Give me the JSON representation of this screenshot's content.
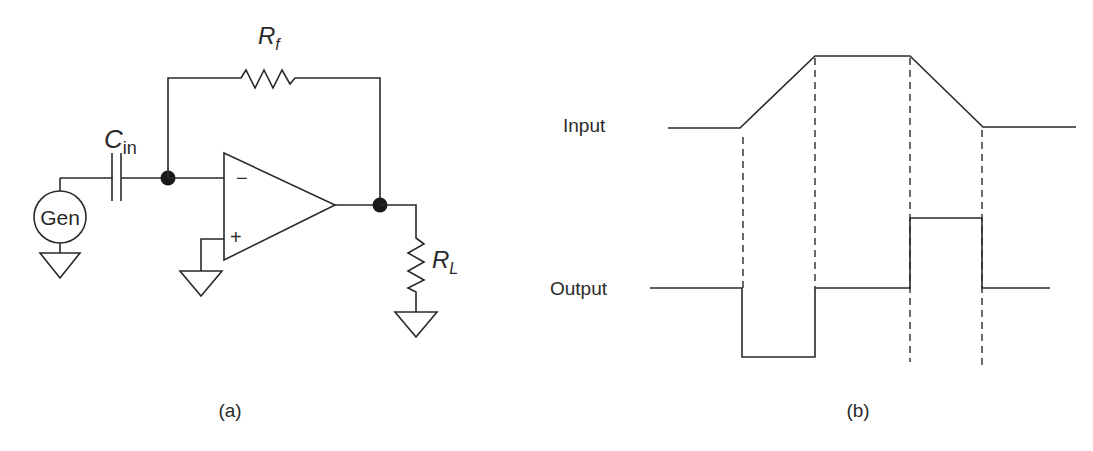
{
  "panel_a": {
    "caption": "(a)",
    "components": {
      "generator": {
        "label": "Gen"
      },
      "input_capacitor": {
        "label_main": "C",
        "label_sub": "in"
      },
      "feedback_resistor": {
        "label_main": "R",
        "label_sub": "f"
      },
      "load_resistor": {
        "label_main": "R",
        "label_sub": "L"
      },
      "opamp": {
        "inverting_symbol": "−",
        "noninverting_symbol": "+"
      }
    }
  },
  "panel_b": {
    "caption": "(b)",
    "signals": {
      "input": {
        "label": "Input"
      },
      "output": {
        "label": "Output"
      }
    }
  },
  "colors": {
    "ink": "#2a2a2a",
    "background": "#ffffff"
  }
}
